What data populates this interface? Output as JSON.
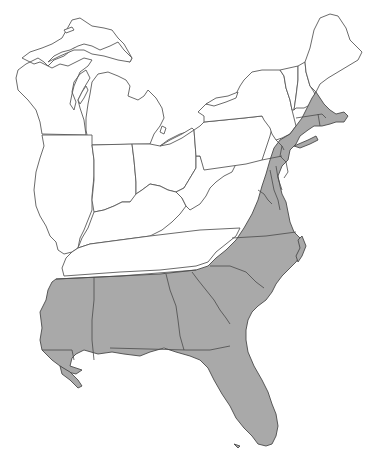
{
  "map": {
    "title": "Eastern United States range map",
    "region": "Eastern United States",
    "colors": {
      "land": "#ffffff",
      "shaded_range": "#a9a9a9",
      "outline": "#5a5a5a",
      "background": "#ffffff"
    },
    "legend": [],
    "labels": [],
    "shaded_states": [
      "Massachusetts",
      "Rhode Island",
      "Connecticut",
      "New Jersey",
      "Delaware",
      "Maryland",
      "Virginia",
      "North Carolina",
      "South Carolina",
      "Georgia",
      "Florida",
      "Alabama",
      "Mississippi",
      "Louisiana",
      "Tennessee (southern edge)",
      "New York (southeastern)",
      "Pennsylvania (southeastern)"
    ],
    "unshaded_states": [
      "Maine",
      "New Hampshire",
      "Vermont",
      "New York",
      "Pennsylvania",
      "Ohio",
      "Michigan",
      "Indiana",
      "Illinois",
      "Wisconsin",
      "Kentucky",
      "West Virginia",
      "Tennessee"
    ]
  }
}
